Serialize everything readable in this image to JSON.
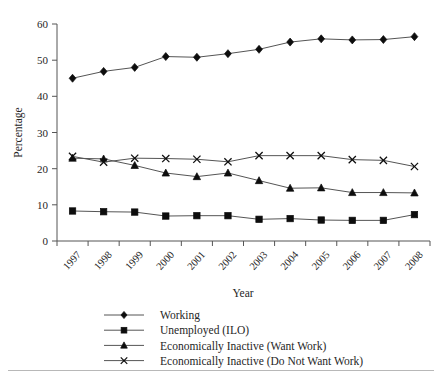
{
  "chart_data": {
    "type": "line",
    "title": "",
    "xlabel": "Year",
    "ylabel": "Percentage",
    "categories": [
      "1997",
      "1998",
      "1999",
      "2000",
      "2001",
      "2002",
      "2003",
      "2004",
      "2005",
      "2006",
      "2007",
      "2008"
    ],
    "ylim": [
      0,
      60
    ],
    "yticks": [
      0,
      10,
      20,
      30,
      40,
      50,
      60
    ],
    "grid": false,
    "legend_position": "bottom",
    "series": [
      {
        "name": "Working",
        "marker": "diamond",
        "values": [
          45.0,
          46.9,
          48.0,
          51.0,
          50.8,
          51.8,
          53.0,
          55.0,
          55.9,
          55.6,
          55.7,
          56.5
        ]
      },
      {
        "name": "Unemployed (ILO)",
        "marker": "square",
        "values": [
          8.3,
          8.1,
          8.0,
          6.9,
          7.0,
          7.0,
          6.0,
          6.2,
          5.8,
          5.7,
          5.7,
          7.3
        ]
      },
      {
        "name": "Economically Inactive (Want Work)",
        "marker": "triangle",
        "values": [
          22.9,
          22.7,
          20.9,
          18.8,
          17.8,
          18.8,
          16.7,
          14.6,
          14.7,
          13.4,
          13.4,
          13.3
        ]
      },
      {
        "name": "Economically Inactive (Do Not Want Work)",
        "marker": "cross",
        "values": [
          23.4,
          21.8,
          22.9,
          22.8,
          22.6,
          21.9,
          23.6,
          23.6,
          23.6,
          22.5,
          22.3,
          20.6
        ]
      }
    ]
  },
  "axes": {
    "y_label": "Percentage",
    "x_label": "Year",
    "y_tick_labels": [
      "0",
      "10",
      "20",
      "30",
      "40",
      "50",
      "60"
    ],
    "x_tick_labels": [
      "1997",
      "1998",
      "1999",
      "2000",
      "2001",
      "2002",
      "2003",
      "2004",
      "2005",
      "2006",
      "2007",
      "2008"
    ]
  },
  "legend": {
    "items": [
      {
        "label": "Working",
        "marker": "diamond-marker"
      },
      {
        "label": "Unemployed (ILO)",
        "marker": "square-marker"
      },
      {
        "label": "Economically Inactive (Want Work)",
        "marker": "triangle-marker"
      },
      {
        "label": "Economically Inactive (Do Not Want Work)",
        "marker": "cross-marker"
      }
    ]
  },
  "colors": {
    "marker": "#0d0d0d",
    "line": "#555555",
    "text": "#262626",
    "background": "#ffffff"
  }
}
